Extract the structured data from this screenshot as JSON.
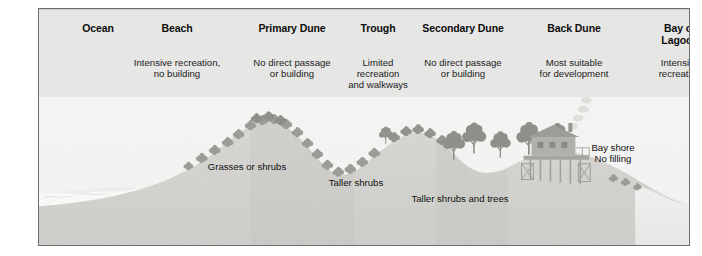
{
  "figure": {
    "frame_color": "#6e6e6e",
    "plate_color": "#e9e9e7"
  },
  "header": {
    "zones": [
      {
        "name": "Ocean",
        "label": "Ocean",
        "x": 14,
        "width": 90,
        "description": ""
      },
      {
        "name": "Beach",
        "label": "Beach",
        "x": 78,
        "width": 120,
        "description": "Intensive recreation,\nno building"
      },
      {
        "name": "Primary Dune",
        "label": "Primary Dune",
        "x": 188,
        "width": 130,
        "description": "No direct passage\nor building"
      },
      {
        "name": "Trough",
        "label": "Trough",
        "x": 294,
        "width": 90,
        "description": "Limited\nrecreation\nand walkways"
      },
      {
        "name": "Secondary Dune",
        "label": "Secondary Dune",
        "x": 354,
        "width": 140,
        "description": "No direct passage\nor building"
      },
      {
        "name": "Back Dune",
        "label": "Back Dune",
        "x": 470,
        "width": 130,
        "description": "Most suitable\nfor development"
      },
      {
        "name": "Bay or Lagoon",
        "label": "Bay or\nLagoon",
        "x": 594,
        "width": 94,
        "description": "Intensive\nrecreation"
      }
    ]
  },
  "captions": [
    {
      "name": "grasses-or-shrubs",
      "text": "Grasses or shrubs",
      "x": 172,
      "y": 160
    },
    {
      "name": "taller-shrubs",
      "text": "Taller shrubs",
      "x": 300,
      "y": 176
    },
    {
      "name": "taller-shrubs-and-trees",
      "text": "Taller shrubs and trees",
      "x": 414,
      "y": 192
    },
    {
      "name": "bay-shore-no-filling",
      "text": "Bay shore\nNo filling",
      "x": 578,
      "y": 141
    }
  ],
  "colors": {
    "sky": "#f2f2f0",
    "sand_light": "#d9d8d4",
    "sand_mid": "#cbcac5",
    "sand_dark": "#bdbcb7",
    "ocean": "#e4e4e2",
    "foam": "#f6f6f4",
    "bay": "#ebebe9",
    "vegetation": "#6a6a64",
    "vegetation_dark": "#4c4c47",
    "house": "#7a7a73",
    "smoke": "#c9c9c5",
    "text": "#111111",
    "heading": "#0d0d0d"
  },
  "scene": {
    "name": "dune-profile-illustration",
    "features": [
      "ocean-waves",
      "beach-slope",
      "primary-dune",
      "trough",
      "secondary-dune",
      "back-dune",
      "stilt-house",
      "bay-water"
    ]
  }
}
